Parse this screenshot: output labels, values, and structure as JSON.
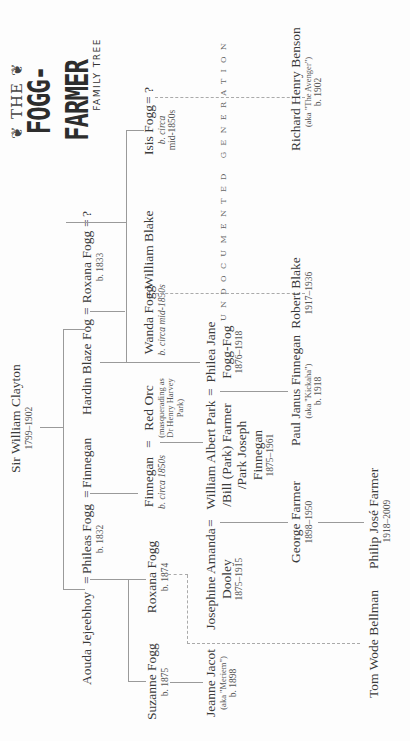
{
  "title": {
    "prefix": "❦ THE ❦",
    "main": "FOGG-FARMER",
    "subtitle": "FAMILY TREE"
  },
  "undocumented_label": "UNDOCUMENTED GENERATION",
  "people": {
    "william_clayton": {
      "name": "Sir William Clayton",
      "dates": "1799–1902"
    },
    "aouda": {
      "name": "Aouda Jejeebhoy"
    },
    "phileas": {
      "name": "Phileas Fogg",
      "dates": "b. 1832"
    },
    "finnegan_sr": {
      "name": "Finnegan"
    },
    "hardin": {
      "name": "Hardin Blaze Fog"
    },
    "roxana_sr": {
      "name": "Roxana Fogg",
      "dates": "b. 1833"
    },
    "unknown_1": {
      "name": "?"
    },
    "suzanne": {
      "name": "Suzanne Fogg",
      "dates": "b. 1875"
    },
    "roxana_jr": {
      "name": "Roxana Fogg",
      "dates": "b. 1874"
    },
    "finnegan_jr": {
      "name": "Finnegan",
      "dates": "b. circa 1850s"
    },
    "red_orc": {
      "name": "Red Orc",
      "note": "(masquerading as Dr Henry Harvey Park)"
    },
    "wanda": {
      "name": "Wanda Fogg",
      "dates": "b. circa mid-1850s"
    },
    "william_blake": {
      "name": "William Blake"
    },
    "isis": {
      "name": "Isis Fogg",
      "dates_1": "b. circa",
      "dates_2": "mid-1850s"
    },
    "unknown_2": {
      "name": "?"
    },
    "jeanne": {
      "name": "Jeanne Jacot",
      "aka": "(aka \"Meriem\")",
      "dates": "b. 1898"
    },
    "josephine": {
      "name_1": "Josephine Amanda",
      "name_2": "Dooley",
      "dates": "1875–1915"
    },
    "william_park": {
      "name_1": "William Albert Park",
      "name_2": "/Bill (Park) Farmer",
      "name_3": "/Park Joseph",
      "name_4": "Finnegan",
      "dates": "1875–1961"
    },
    "philea": {
      "name_1": "Philea Jane",
      "name_2": "Fogg-Fog",
      "dates": "1876–1918"
    },
    "george": {
      "name": "George Farmer",
      "dates": "1898–1950"
    },
    "paul": {
      "name": "Paul Janus Finnegan",
      "aka": "(aka \"Kickaha\")",
      "dates": "b. 1918"
    },
    "robert_blake": {
      "name": "Robert Blake",
      "dates": "1917–1936"
    },
    "richard_benson": {
      "name": "Richard Henry Benson",
      "aka": "(aka \"The Avenger\")",
      "dates": "b. 1902"
    },
    "tom_bellman": {
      "name": "Tom Wode Bellman"
    },
    "philip": {
      "name": "Philip José Farmer",
      "dates": "1918–2009"
    }
  },
  "marriage_symbol": "=",
  "colors": {
    "background": "#fdfdfd",
    "text": "#3a3a3a",
    "line": "#9a9a9a"
  }
}
